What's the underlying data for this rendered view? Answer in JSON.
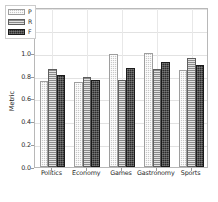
{
  "chart_data": {
    "type": "bar",
    "title": "",
    "subtitle": "",
    "xlabel": "",
    "ylabel": "Metric",
    "categories": [
      "Politics",
      "Economy",
      "Games",
      "Gastronomy",
      "Sports"
    ],
    "series": [
      {
        "name": "P",
        "values": [
          0.755,
          0.745,
          0.985,
          1.0,
          0.85
        ],
        "color": "#c8c8c8",
        "hatch": "dotted"
      },
      {
        "name": "R",
        "values": [
          0.855,
          0.785,
          0.76,
          0.855,
          0.955
        ],
        "color": "#8a8a8a",
        "hatch": "horizontal-lines"
      },
      {
        "name": "F",
        "values": [
          0.805,
          0.765,
          0.865,
          0.92,
          0.895
        ],
        "color": "#2b2b2b",
        "hatch": "dotted-dark"
      }
    ],
    "ylim": [
      0.0,
      1.4
    ],
    "ytick_labels": [
      "0.0",
      "0.2",
      "0.4",
      "0.6",
      "0.8",
      "1.0",
      "1.2",
      "1.4"
    ],
    "ytick_values": [
      0.0,
      0.2,
      0.4,
      0.6,
      0.8,
      1.0,
      1.2,
      1.4
    ],
    "grid": true,
    "grid_axis": "both",
    "legend_position": "upper left",
    "legend_entries": [
      "P",
      "R",
      "F"
    ]
  }
}
